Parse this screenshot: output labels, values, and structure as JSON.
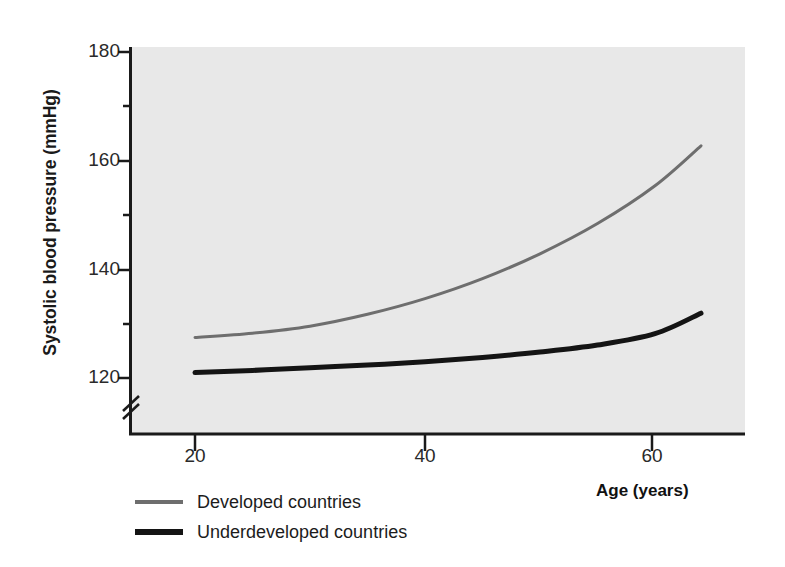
{
  "chart_data": {
    "type": "line",
    "title": "",
    "xlabel": "Age (years)",
    "ylabel": "Systolic blood pressure (mmHg)",
    "xlim": [
      14,
      68
    ],
    "ylim": [
      115,
      183
    ],
    "xticks": [
      20,
      40,
      60
    ],
    "xtick_labels": [
      "20",
      "40",
      "60"
    ],
    "yticks": [
      120,
      140,
      160,
      180
    ],
    "ytick_labels": [
      "120",
      "140",
      "160",
      "180"
    ],
    "y_minor_ticks": [
      130,
      150,
      170
    ],
    "y_axis_break": true,
    "y_axis_break_symbol": "//",
    "grid": false,
    "plot_background_color": "#e8e8e8",
    "legend_position": "below-left",
    "x": [
      20,
      25,
      30,
      35,
      40,
      45,
      50,
      55,
      60,
      64
    ],
    "series": [
      {
        "name": "Developed countries",
        "color": "#6e6e6e",
        "line_width": 3,
        "values": [
          127.5,
          128.3,
          129.6,
          131.8,
          134.7,
          138.4,
          143.0,
          148.6,
          155.6,
          163.0
        ]
      },
      {
        "name": "Underdeveloped countries",
        "color": "#141414",
        "line_width": 5,
        "values": [
          121.0,
          121.4,
          121.9,
          122.4,
          123.0,
          123.8,
          124.8,
          126.1,
          128.2,
          132.0
        ]
      }
    ]
  },
  "legend": {
    "items": [
      {
        "label": "Developed countries"
      },
      {
        "label": "Underdeveloped countries"
      }
    ]
  }
}
